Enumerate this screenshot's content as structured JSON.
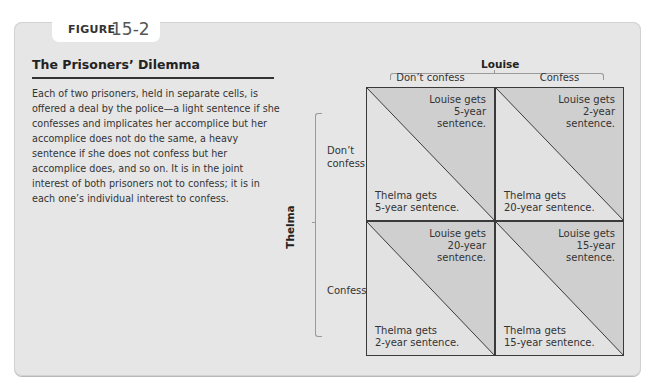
{
  "figure": {
    "label": "FIGURE",
    "number": "15-2",
    "title": "The Prisoners’ Dilemma",
    "description": "Each of two prisoners, held in separate cells, is offered a deal by the police—a light sentence if she confesses and implicates her accomplice but her accomplice does not do the same, a heavy sentence if she does not confess but her accomplice does, and so on. It is in the joint interest of both prisoners not to confess; it is in each one’s individual interest to confess."
  },
  "matrix": {
    "column_player": "Louise",
    "row_player": "Thelma",
    "columns": [
      "Don’t confess",
      "Confess"
    ],
    "rows": [
      "Don’t\nconfess",
      "Confess"
    ],
    "cells": [
      {
        "louise_line1": "Louise gets",
        "louise_line2": "5-year",
        "louise_line3": "sentence.",
        "thelma_line1": "Thelma gets",
        "thelma_line2": "5-year sentence."
      },
      {
        "louise_line1": "Louise gets",
        "louise_line2": "2-year",
        "louise_line3": "sentence.",
        "thelma_line1": "Thelma gets",
        "thelma_line2": "20-year sentence."
      },
      {
        "louise_line1": "Louise gets",
        "louise_line2": "20-year",
        "louise_line3": "sentence.",
        "thelma_line1": "Thelma gets",
        "thelma_line2": "2-year sentence."
      },
      {
        "louise_line1": "Louise gets",
        "louise_line2": "15-year",
        "louise_line3": "sentence.",
        "thelma_line1": "Thelma gets",
        "thelma_line2": "15-year sentence."
      }
    ]
  },
  "colors": {
    "panel_bg": "#e6e6e6",
    "upper_triangle": "#cfcfcf",
    "lower_triangle": "#e2e2e2",
    "grid_line": "#3a3a3a"
  }
}
